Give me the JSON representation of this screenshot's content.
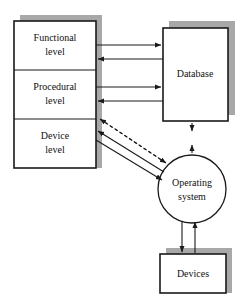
{
  "diagram": {
    "background_color": "#ffffff",
    "line_color": "#1a1a1a",
    "shadow_color": "#a8a8a8",
    "box_fill_color": "#ffffff",
    "nodes": {
      "functional_level": {
        "label_line1": "Functional",
        "label_line2": "level"
      },
      "procedural_level": {
        "label_line1": "Procedural",
        "label_line2": "level"
      },
      "device_level": {
        "label_line1": "Device",
        "label_line2": "level"
      },
      "database": {
        "label": "Database"
      },
      "operating_system": {
        "label_line1": "Operating",
        "label_line2": "system"
      },
      "devices": {
        "label": "Devices"
      }
    },
    "connections": [
      {
        "name": "functional-to-database",
        "style": "solid",
        "direction": "right"
      },
      {
        "name": "database-to-functional",
        "style": "solid",
        "direction": "left"
      },
      {
        "name": "procedural-to-database",
        "style": "solid",
        "direction": "right"
      },
      {
        "name": "database-to-procedural",
        "style": "solid",
        "direction": "left"
      },
      {
        "name": "database-to-operating-system",
        "style": "dashed",
        "direction": "both"
      },
      {
        "name": "operating-system-to-device-level-dashed",
        "style": "dashed",
        "direction": "both"
      },
      {
        "name": "device-level-to-operating-system",
        "style": "solid",
        "direction": "right"
      },
      {
        "name": "operating-system-to-device-level",
        "style": "solid",
        "direction": "left"
      },
      {
        "name": "operating-system-to-devices",
        "style": "solid",
        "direction": "down"
      },
      {
        "name": "devices-to-operating-system",
        "style": "solid",
        "direction": "up"
      }
    ]
  }
}
